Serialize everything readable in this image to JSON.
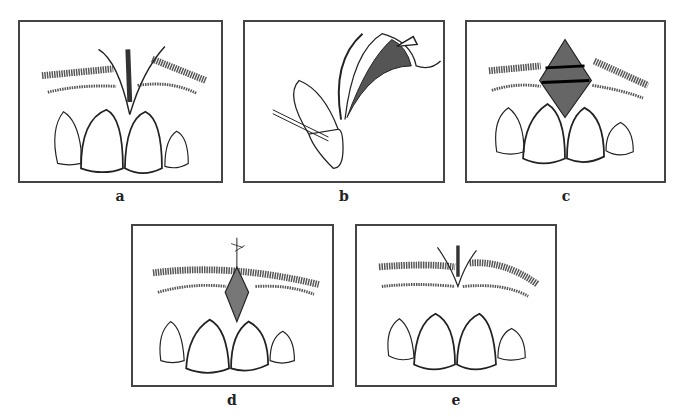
{
  "figure": {
    "panels": [
      {
        "id": "a",
        "label": "a",
        "content": "Frontal view of maxillary anterior teeth with hypertrophic frenum inserting between central incisors; V-shaped incision outline"
      },
      {
        "id": "b",
        "label": "b",
        "content": "Sagittal cross-section of incisor with flap reflected; stippled tissue and arrow indicating direction"
      },
      {
        "id": "c",
        "label": "c",
        "content": "Frontal view with diamond-shaped stippled graft/defect placed above central incisors, with two horizontal bands"
      },
      {
        "id": "d",
        "label": "d",
        "content": "Frontal view with diamond-shaped wound sutured at the apex"
      },
      {
        "id": "e",
        "label": "e",
        "content": "Frontal view showing healed result with reduced frenum between central incisors"
      }
    ]
  },
  "colors": {
    "line": "#222222",
    "border": "#444444",
    "fill_dark": "#555555",
    "background": "#ffffff"
  }
}
